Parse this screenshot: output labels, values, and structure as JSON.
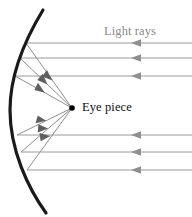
{
  "figure": {
    "width": 192,
    "height": 217,
    "background_color": "#ffffff"
  },
  "labels": {
    "light_rays": "Light rays",
    "eye_piece": "Eye piece"
  },
  "colors": {
    "mirror": "#1a1a1a",
    "incoming_ray": "#9a9a9a",
    "reflected_ray": "#8f8f8f",
    "focus_dot": "#000000",
    "light_rays_text": "#8a8a8a",
    "eye_piece_text": "#111111"
  },
  "geometry": {
    "mirror": {
      "type": "parabolic-arc",
      "vertex": [
        10,
        110
      ],
      "top_end": [
        43,
        10
      ],
      "bottom_end": [
        46,
        213
      ],
      "stroke_width": 3.2
    },
    "focus": {
      "x": 72,
      "y": 108,
      "dot_radius": 2.6
    },
    "incoming_rays": [
      {
        "y": 43,
        "x_start": 192,
        "x_end": 26,
        "arrow_x": 136
      },
      {
        "y": 58,
        "x_start": 192,
        "x_end": 20,
        "arrow_x": 136
      },
      {
        "y": 76,
        "x_start": 192,
        "x_end": 15,
        "arrow_x": 136
      },
      {
        "y": 135,
        "x_start": 192,
        "x_end": 17,
        "arrow_x": 136
      },
      {
        "y": 152,
        "x_start": 192,
        "x_end": 21,
        "arrow_x": 136
      },
      {
        "y": 170,
        "x_start": 192,
        "x_end": 27,
        "arrow_x": 136
      }
    ],
    "reflected_rays": [
      {
        "from": [
          26,
          43
        ],
        "to": [
          72,
          108
        ],
        "arrow_t": 0.42
      },
      {
        "from": [
          20,
          58
        ],
        "to": [
          72,
          108
        ],
        "arrow_t": 0.42
      },
      {
        "from": [
          15,
          76
        ],
        "to": [
          72,
          108
        ],
        "arrow_t": 0.42
      },
      {
        "from": [
          17,
          135
        ],
        "to": [
          72,
          108
        ],
        "arrow_t": 0.42
      },
      {
        "from": [
          21,
          152
        ],
        "to": [
          72,
          108
        ],
        "arrow_t": 0.42
      },
      {
        "from": [
          27,
          170
        ],
        "to": [
          72,
          108
        ],
        "arrow_t": 0.42
      }
    ]
  }
}
